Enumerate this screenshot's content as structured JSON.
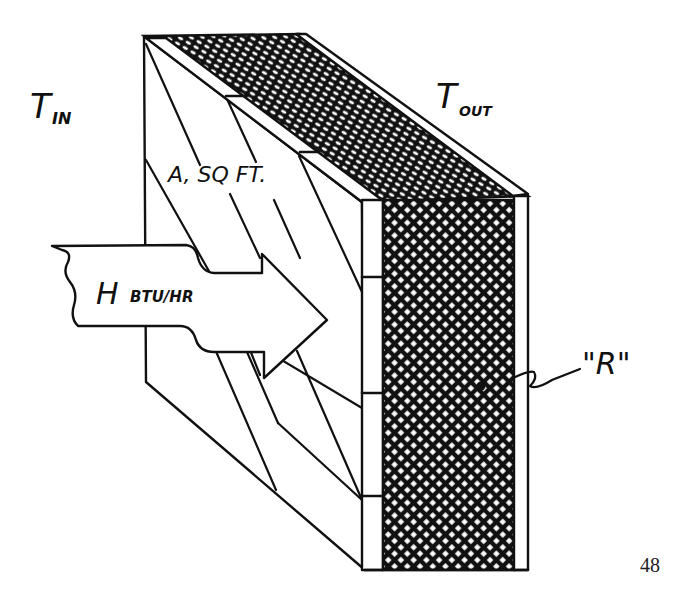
{
  "figure": {
    "type": "isometric wall section illustrating heat flow",
    "labels": {
      "inside_temp": "T",
      "inside_temp_sub": "IN",
      "outside_temp": "T",
      "outside_temp_sub": "OUT",
      "area": "A, SQ FT.",
      "heat_flow": "H",
      "heat_flow_unit": "BTU/HR",
      "resistance": "\"R\""
    },
    "page_number": "48"
  },
  "colors": {
    "ink": "#111111",
    "paper": "#ffffff"
  }
}
